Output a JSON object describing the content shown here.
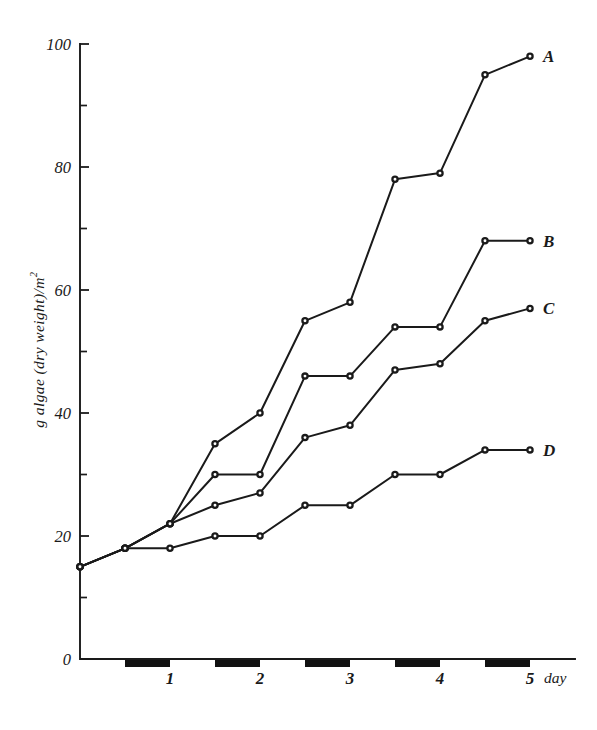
{
  "chart_data": {
    "type": "line",
    "title": "",
    "xlabel": "day",
    "ylabel": "g algae (dry weight)/m2",
    "ylabel_display": "g algae (dry weight)/m",
    "ylabel_exponent": "2",
    "xlim": [
      0,
      5.5
    ],
    "ylim": [
      0,
      100
    ],
    "grid": false,
    "legend_position": "right-of-line-ends",
    "y_ticks_major": [
      0,
      20,
      40,
      60,
      80,
      100
    ],
    "y_ticks_minor": [
      10,
      30,
      50,
      70,
      90
    ],
    "y_tick_labels": [
      "0",
      "20",
      "40",
      "60",
      "80",
      "100"
    ],
    "x_ticks": [
      1,
      2,
      3,
      4,
      5
    ],
    "x_tick_labels": [
      "1",
      "2",
      "3",
      "4",
      "5"
    ],
    "x_unit_label": "day",
    "night_bars": [
      {
        "start": 0.5,
        "end": 1.0
      },
      {
        "start": 1.5,
        "end": 2.0
      },
      {
        "start": 2.5,
        "end": 3.0
      },
      {
        "start": 3.5,
        "end": 4.0
      },
      {
        "start": 4.5,
        "end": 5.0
      }
    ],
    "series": [
      {
        "name": "A",
        "label": "A",
        "x": [
          0,
          0.5,
          1.0,
          1.5,
          2.0,
          2.5,
          3.0,
          3.5,
          4.0,
          4.5,
          5.0
        ],
        "values": [
          15,
          18,
          22,
          35,
          40,
          55,
          58,
          78,
          79,
          95,
          98
        ]
      },
      {
        "name": "B",
        "label": "B",
        "x": [
          0,
          0.5,
          1.0,
          1.5,
          2.0,
          2.5,
          3.0,
          3.5,
          4.0,
          4.5,
          5.0
        ],
        "values": [
          15,
          18,
          22,
          30,
          30,
          46,
          46,
          54,
          54,
          68,
          68
        ]
      },
      {
        "name": "C",
        "label": "C",
        "x": [
          0,
          0.5,
          1.0,
          1.5,
          2.0,
          2.5,
          3.0,
          3.5,
          4.0,
          4.5,
          5.0
        ],
        "values": [
          15,
          18,
          22,
          25,
          27,
          36,
          38,
          47,
          48,
          55,
          57
        ]
      },
      {
        "name": "D",
        "label": "D",
        "x": [
          0,
          0.5,
          1.0,
          1.5,
          2.0,
          2.5,
          3.0,
          3.5,
          4.0,
          4.5,
          5.0
        ],
        "values": [
          15,
          18,
          18,
          20,
          20,
          25,
          25,
          30,
          30,
          34,
          34
        ]
      }
    ]
  }
}
